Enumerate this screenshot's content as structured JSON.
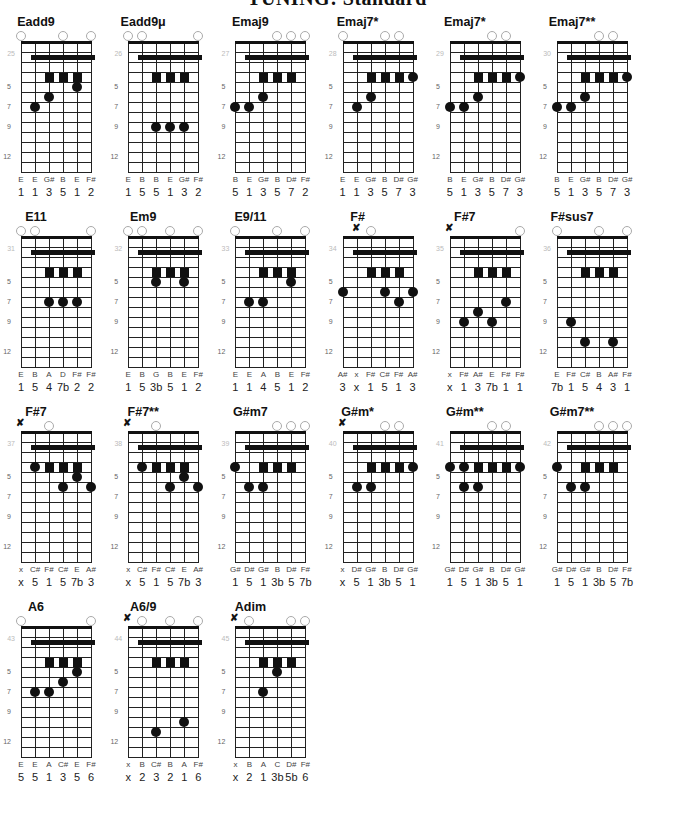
{
  "title": "TUNING: Standard",
  "layout": {
    "origin_x": 21,
    "origin_y": 15,
    "col_step": 107.2,
    "row_step": 195
  },
  "colors": {
    "ink": "#111111",
    "open_circle": "#aaaaaa",
    "index_text": "#bbbbbb"
  },
  "fret_labels": [
    {
      "label": "5",
      "row": 4
    },
    {
      "label": "7",
      "row": 6
    },
    {
      "label": "9",
      "row": 8
    },
    {
      "label": "12",
      "row": 11
    }
  ],
  "charts": [
    {
      "index": "25",
      "name": "Eadd9",
      "open": [
        0,
        3,
        5
      ],
      "mute": [],
      "squares": [
        2,
        3,
        4
      ],
      "dots": [
        [
          0,
          -1
        ],
        [
          4,
          4
        ],
        [
          2,
          5
        ],
        [
          1,
          6
        ]
      ],
      "notes": [
        "E",
        "E",
        "G#",
        "B",
        "E",
        "F#"
      ],
      "intervals": [
        "1",
        "1",
        "3",
        "5",
        "1",
        "2"
      ]
    },
    {
      "index": "26",
      "name": "Eadd9μ",
      "open": [
        0,
        1,
        5
      ],
      "mute": [],
      "squares": [
        2,
        3,
        4
      ],
      "dots": [
        [
          2,
          8
        ],
        [
          3,
          8
        ],
        [
          4,
          8
        ]
      ],
      "notes": [
        "E",
        "B",
        "B",
        "E",
        "G#",
        "F#"
      ],
      "intervals": [
        "1",
        "5",
        "5",
        "1",
        "3",
        "2"
      ]
    },
    {
      "index": "27",
      "name": "Emaj9",
      "open": [
        3,
        4,
        5
      ],
      "mute": [],
      "squares": [
        2,
        3,
        4
      ],
      "dots": [
        [
          2,
          5
        ],
        [
          0,
          6
        ],
        [
          1,
          6
        ]
      ],
      "notes": [
        "B",
        "E",
        "G#",
        "B",
        "D#",
        "F#"
      ],
      "intervals": [
        "5",
        "1",
        "3",
        "5",
        "7",
        "2"
      ]
    },
    {
      "index": "28",
      "name": "Emaj7*",
      "open": [
        0,
        3,
        4
      ],
      "mute": [],
      "squares": [
        2,
        3,
        4
      ],
      "dots": [
        [
          5,
          3
        ],
        [
          2,
          5
        ],
        [
          1,
          6
        ]
      ],
      "notes": [
        "E",
        "E",
        "G#",
        "B",
        "D#",
        "G#"
      ],
      "intervals": [
        "1",
        "1",
        "3",
        "5",
        "7",
        "3"
      ]
    },
    {
      "index": "29",
      "name": "Emaj7*",
      "open": [
        3,
        4
      ],
      "mute": [],
      "squares": [
        2,
        3,
        4
      ],
      "dots": [
        [
          5,
          3
        ],
        [
          2,
          5
        ],
        [
          0,
          6
        ],
        [
          1,
          6
        ]
      ],
      "notes": [
        "B",
        "E",
        "G#",
        "B",
        "D#",
        "G#"
      ],
      "intervals": [
        "5",
        "1",
        "3",
        "5",
        "7",
        "3"
      ]
    },
    {
      "index": "30",
      "name": "Emaj7**",
      "open": [
        3,
        4
      ],
      "mute": [],
      "squares": [
        2,
        3,
        4
      ],
      "dots": [
        [
          5,
          3
        ],
        [
          2,
          5
        ],
        [
          0,
          6
        ],
        [
          1,
          6
        ]
      ],
      "notes": [
        "B",
        "E",
        "G#",
        "B",
        "D#",
        "G#"
      ],
      "intervals": [
        "5",
        "1",
        "3",
        "5",
        "7",
        "3"
      ]
    },
    {
      "index": "31",
      "name": "E11",
      "open": [
        0,
        1,
        5
      ],
      "mute": [],
      "squares": [
        2,
        3,
        4
      ],
      "dots": [
        [
          2,
          6
        ],
        [
          3,
          6
        ],
        [
          4,
          6
        ]
      ],
      "notes": [
        "E",
        "B",
        "A",
        "D",
        "F#",
        "F#"
      ],
      "intervals": [
        "1",
        "5",
        "4",
        "7b",
        "2",
        "2"
      ]
    },
    {
      "index": "32",
      "name": "Em9",
      "open": [
        0,
        1,
        3,
        5
      ],
      "mute": [],
      "squares": [
        2,
        3,
        4
      ],
      "dots": [
        [
          2,
          4
        ],
        [
          4,
          4
        ]
      ],
      "notes": [
        "E",
        "B",
        "G",
        "B",
        "E",
        "F#"
      ],
      "intervals": [
        "1",
        "5",
        "3b",
        "5",
        "1",
        "2"
      ]
    },
    {
      "index": "33",
      "name": "E9/11",
      "open": [
        0,
        3,
        5
      ],
      "mute": [],
      "squares": [
        2,
        3,
        4
      ],
      "dots": [
        [
          4,
          4
        ],
        [
          1,
          6
        ],
        [
          2,
          6
        ]
      ],
      "notes": [
        "E",
        "E",
        "A",
        "B",
        "E",
        "F#"
      ],
      "intervals": [
        "1",
        "1",
        "4",
        "5",
        "1",
        "2"
      ]
    },
    {
      "index": "34",
      "name": "F#",
      "open": [
        2
      ],
      "mute": [
        1
      ],
      "squares": [
        2,
        3,
        4
      ],
      "dots": [
        [
          0,
          5
        ],
        [
          3,
          5
        ],
        [
          5,
          5
        ],
        [
          4,
          6
        ]
      ],
      "notes": [
        "A#",
        "x",
        "F#",
        "C#",
        "F#",
        "A#"
      ],
      "intervals": [
        "3",
        "x",
        "1",
        "5",
        "1",
        "3"
      ]
    },
    {
      "index": "35",
      "name": "F#7",
      "open": [
        5
      ],
      "mute": [
        0
      ],
      "squares": [
        2,
        3,
        4
      ],
      "dots": [
        [
          4,
          6
        ],
        [
          2,
          7
        ],
        [
          1,
          8
        ],
        [
          3,
          8
        ]
      ],
      "notes": [
        "x",
        "F#",
        "A#",
        "E",
        "F#",
        "F#"
      ],
      "intervals": [
        "x",
        "1",
        "3",
        "7b",
        "1",
        "1"
      ]
    },
    {
      "index": "36",
      "name": "F#sus7",
      "open": [
        0,
        3,
        5
      ],
      "mute": [],
      "squares": [
        2,
        3,
        4
      ],
      "dots": [
        [
          1,
          8
        ],
        [
          2,
          10
        ],
        [
          4,
          10
        ]
      ],
      "notes": [
        "E",
        "F#",
        "C#",
        "B",
        "A#",
        "F#"
      ],
      "intervals": [
        "7b",
        "1",
        "5",
        "4",
        "3",
        "1"
      ]
    },
    {
      "index": "37",
      "name": "F#7",
      "open": [
        2
      ],
      "mute": [
        0
      ],
      "squares": [
        2,
        3,
        4
      ],
      "dots": [
        [
          1,
          3
        ],
        [
          4,
          4
        ],
        [
          3,
          5
        ],
        [
          5,
          5
        ]
      ],
      "notes": [
        "x",
        "C#",
        "F#",
        "C#",
        "E",
        "A#"
      ],
      "intervals": [
        "x",
        "5",
        "1",
        "5",
        "7b",
        "3"
      ]
    },
    {
      "index": "38",
      "name": "F#7**",
      "open": [
        2
      ],
      "mute": [
        0
      ],
      "squares": [
        2,
        3,
        4
      ],
      "dots": [
        [
          1,
          3
        ],
        [
          4,
          4
        ],
        [
          3,
          5
        ],
        [
          5,
          5
        ]
      ],
      "notes": [
        "x",
        "C#",
        "F#",
        "C#",
        "E",
        "A#"
      ],
      "intervals": [
        "x",
        "5",
        "1",
        "5",
        "7b",
        "3"
      ]
    },
    {
      "index": "39",
      "name": "G#m7",
      "open": [
        3,
        4,
        5
      ],
      "mute": [],
      "squares": [
        2,
        3,
        4
      ],
      "dots": [
        [
          0,
          3
        ],
        [
          1,
          5
        ],
        [
          2,
          5
        ]
      ],
      "notes": [
        "G#",
        "D#",
        "G#",
        "B",
        "D#",
        "F#"
      ],
      "intervals": [
        "1",
        "5",
        "1",
        "3b",
        "5",
        "7b"
      ]
    },
    {
      "index": "40",
      "name": "G#m*",
      "open": [
        3,
        4
      ],
      "mute": [
        0
      ],
      "squares": [
        2,
        3,
        4
      ],
      "dots": [
        [
          5,
          3
        ],
        [
          1,
          5
        ],
        [
          2,
          5
        ]
      ],
      "notes": [
        "x",
        "D#",
        "G#",
        "B",
        "D#",
        "G#"
      ],
      "intervals": [
        "x",
        "5",
        "1",
        "3b",
        "5",
        "1"
      ]
    },
    {
      "index": "41",
      "name": "G#m**",
      "open": [
        3,
        4
      ],
      "mute": [],
      "squares": [
        2,
        3,
        4
      ],
      "dots": [
        [
          0,
          3
        ],
        [
          1,
          3
        ],
        [
          5,
          3
        ],
        [
          1,
          5
        ],
        [
          2,
          5
        ]
      ],
      "notes": [
        "G#",
        "D#",
        "G#",
        "B",
        "D#",
        "G#"
      ],
      "intervals": [
        "1",
        "5",
        "1",
        "3b",
        "5",
        "1"
      ]
    },
    {
      "index": "42",
      "name": "G#m7**",
      "open": [
        3,
        4,
        5
      ],
      "mute": [],
      "squares": [
        2,
        3,
        4
      ],
      "dots": [
        [
          0,
          3
        ],
        [
          1,
          5
        ],
        [
          2,
          5
        ]
      ],
      "notes": [
        "G#",
        "D#",
        "G#",
        "B",
        "D#",
        "F#"
      ],
      "intervals": [
        "1",
        "5",
        "1",
        "3b",
        "5",
        "7b"
      ]
    },
    {
      "index": "43",
      "name": "A6",
      "open": [
        0,
        5
      ],
      "mute": [],
      "squares": [
        2,
        3,
        4
      ],
      "dots": [
        [
          4,
          4
        ],
        [
          3,
          5
        ],
        [
          1,
          6
        ],
        [
          2,
          6
        ]
      ],
      "notes": [
        "E",
        "E",
        "A",
        "C#",
        "E",
        "F#"
      ],
      "intervals": [
        "5",
        "5",
        "1",
        "3",
        "5",
        "6"
      ]
    },
    {
      "index": "44",
      "name": "A6/9",
      "open": [
        1,
        3,
        5
      ],
      "mute": [
        0
      ],
      "squares": [
        2,
        3,
        4
      ],
      "dots": [
        [
          4,
          9
        ],
        [
          2,
          10
        ]
      ],
      "notes": [
        "x",
        "B",
        "C#",
        "B",
        "A",
        "F#"
      ],
      "intervals": [
        "x",
        "2",
        "3",
        "2",
        "1",
        "6"
      ]
    },
    {
      "index": "45",
      "name": "Adim",
      "open": [
        1,
        4,
        5
      ],
      "mute": [
        0
      ],
      "squares": [
        2,
        3,
        4
      ],
      "dots": [
        [
          3,
          4
        ],
        [
          2,
          6
        ]
      ],
      "notes": [
        "x",
        "B",
        "A",
        "C",
        "D#",
        "F#"
      ],
      "intervals": [
        "x",
        "2",
        "1",
        "3b",
        "5b",
        "6"
      ]
    }
  ]
}
